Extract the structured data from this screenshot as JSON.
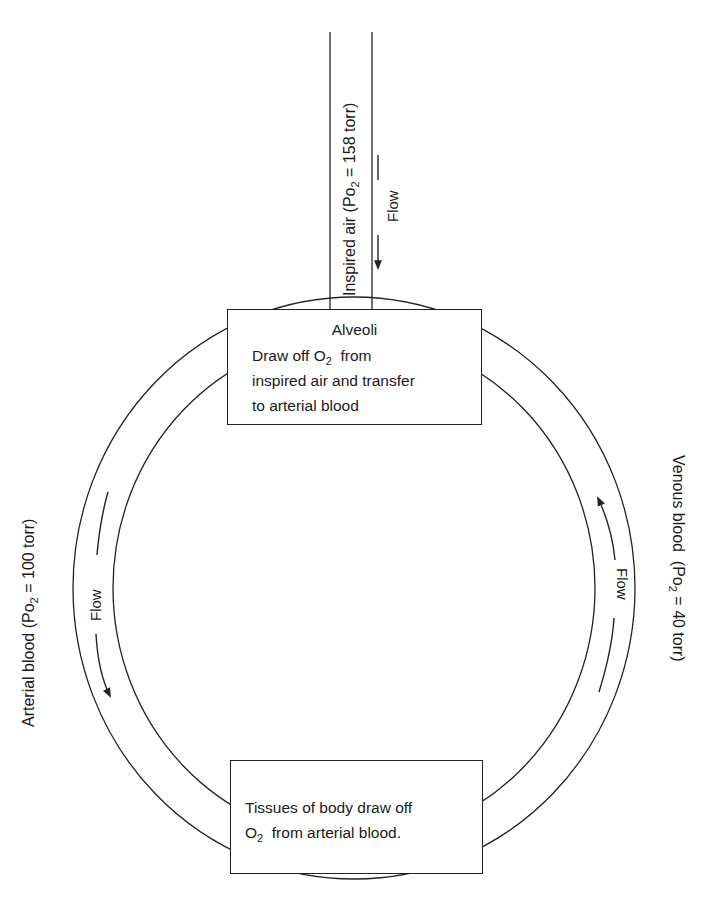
{
  "diagram": {
    "inspired_air": {
      "label_prefix": "Inspired air (Po",
      "label_sub": "2",
      "label_suffix": " = 158 torr)",
      "flow_label": "Flow"
    },
    "alveoli": {
      "title": "Alveoli",
      "line1_prefix": "Draw off O",
      "line1_sub": "2",
      "line1_suffix": "  from",
      "line2": "inspired air and transfer",
      "line3": "to arterial blood"
    },
    "arterial_blood": {
      "label_prefix": "Arterial blood (Po",
      "label_sub": "2",
      "label_suffix": " = 100 torr)",
      "flow_label": "Flow"
    },
    "venous_blood": {
      "label_prefix": "Venous blood  (Po",
      "label_sub": "2",
      "label_suffix": " = 40 torr)",
      "flow_label": "Flow"
    },
    "tissues": {
      "line1": "Tissues of body draw off",
      "line2_prefix": "O",
      "line2_sub": "2",
      "line2_suffix": "  from arterial blood."
    },
    "colors": {
      "line": "#222222",
      "background": "#ffffff"
    }
  }
}
